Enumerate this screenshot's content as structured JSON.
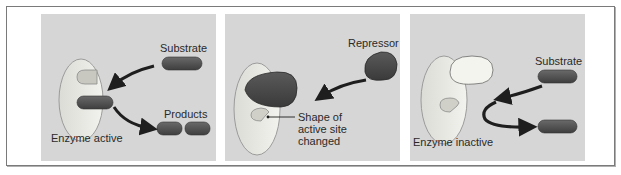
{
  "figure": {
    "colors": {
      "panel_bg": "#d6d6d6",
      "enzyme_fill": "#e9e9e4",
      "substrate_fill": "#555555",
      "repressor_fill": "#4e4e4e",
      "arrow": "#1e1e1e",
      "frame_border": "#7a7a7a"
    },
    "panels": [
      {
        "id": "enzyme-active",
        "labels": {
          "substrate": "Substrate",
          "products": "Products",
          "caption": "Enzyme active"
        }
      },
      {
        "id": "repressor-binding",
        "labels": {
          "repressor": "Repressor",
          "annotation_line1": "Shape of",
          "annotation_line2": "active site",
          "annotation_line3": "changed"
        }
      },
      {
        "id": "enzyme-inactive",
        "labels": {
          "substrate": "Substrate",
          "caption": "Enzyme inactive"
        }
      }
    ]
  }
}
